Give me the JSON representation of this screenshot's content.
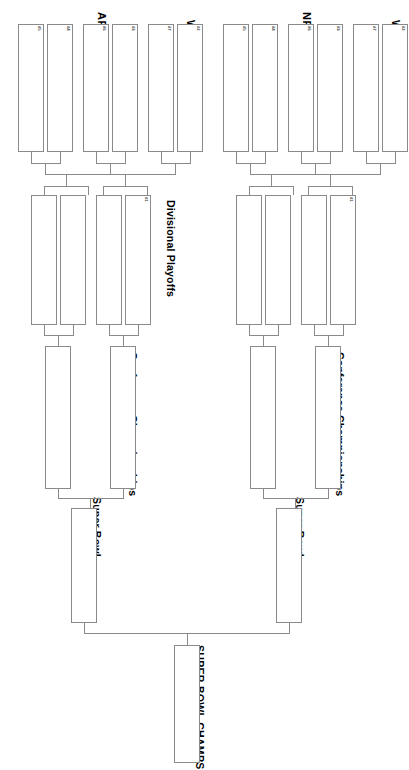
{
  "conferences": [
    {
      "id": "afc",
      "name": "AFC"
    },
    {
      "id": "nfc",
      "name": "NFC"
    }
  ],
  "rounds": {
    "wildcard": "Wildcard Round",
    "divisional": "Divisional Playoffs",
    "conference": "Conference Championships",
    "superbowl": "Super Bowl",
    "champion": "SUPER BOWL CHAMPS"
  },
  "seeds": {
    "wildcard": [
      "#5",
      "#4",
      "#6",
      "#3",
      "#7",
      "#2"
    ],
    "divisional_bye": "#1"
  },
  "afc": {
    "wildcard_games": [
      {
        "seeds": [
          "#5",
          "#4"
        ],
        "teams": [
          "",
          ""
        ]
      },
      {
        "seeds": [
          "#6",
          "#3"
        ],
        "teams": [
          "",
          ""
        ]
      },
      {
        "seeds": [
          "#7",
          "#2"
        ],
        "teams": [
          "",
          ""
        ]
      }
    ],
    "divisional_games": [
      {
        "teams": [
          "",
          ""
        ]
      },
      {
        "teams": [
          "",
          ""
        ],
        "bye_seed": "#1"
      }
    ],
    "conference_game": {
      "teams": [
        "",
        ""
      ]
    },
    "superbowl_slot": {
      "team": ""
    }
  },
  "nfc": {
    "wildcard_games": [
      {
        "seeds": [
          "#5",
          "#4"
        ],
        "teams": [
          "",
          ""
        ]
      },
      {
        "seeds": [
          "#6",
          "#3"
        ],
        "teams": [
          "",
          ""
        ]
      },
      {
        "seeds": [
          "#7",
          "#2"
        ],
        "teams": [
          "",
          ""
        ]
      }
    ],
    "divisional_games": [
      {
        "teams": [
          "",
          ""
        ]
      },
      {
        "teams": [
          "",
          ""
        ],
        "bye_seed": "#1"
      }
    ],
    "conference_game": {
      "teams": [
        "",
        ""
      ]
    },
    "superbowl_slot": {
      "team": ""
    }
  },
  "champion_slot": {
    "team": ""
  },
  "colors": {
    "line": "#8a8a8a",
    "text": "#000000",
    "background": "#ffffff"
  }
}
